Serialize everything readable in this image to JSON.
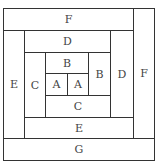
{
  "diagram": {
    "title": "",
    "pieces": [
      {
        "id": "F-top",
        "label": "F",
        "x": 3,
        "y": 8,
        "w": 130,
        "h": 22
      },
      {
        "id": "F-right",
        "label": "F",
        "x": 133,
        "y": 8,
        "w": 21,
        "h": 130
      },
      {
        "id": "E-left",
        "label": "E",
        "x": 3,
        "y": 30,
        "w": 21,
        "h": 108
      },
      {
        "id": "D-top",
        "label": "D",
        "x": 24,
        "y": 30,
        "w": 86,
        "h": 22
      },
      {
        "id": "D-right",
        "label": "D",
        "x": 110,
        "y": 30,
        "w": 23,
        "h": 87
      },
      {
        "id": "C-left",
        "label": "C",
        "x": 24,
        "y": 52,
        "w": 21,
        "h": 65
      },
      {
        "id": "B-top",
        "label": "B",
        "x": 45,
        "y": 52,
        "w": 43,
        "h": 21
      },
      {
        "id": "B-right",
        "label": "B",
        "x": 88,
        "y": 52,
        "w": 22,
        "h": 43
      },
      {
        "id": "A-left",
        "label": "A",
        "x": 45,
        "y": 73,
        "w": 22,
        "h": 22
      },
      {
        "id": "A-right",
        "label": "A",
        "x": 67,
        "y": 73,
        "w": 21,
        "h": 22
      },
      {
        "id": "C-bottom",
        "label": "C",
        "x": 45,
        "y": 95,
        "w": 65,
        "h": 22
      },
      {
        "id": "E-bottom",
        "label": "E",
        "x": 24,
        "y": 117,
        "w": 109,
        "h": 21
      },
      {
        "id": "G-bottom",
        "label": "G",
        "x": 3,
        "y": 138,
        "w": 151,
        "h": 22
      }
    ]
  }
}
